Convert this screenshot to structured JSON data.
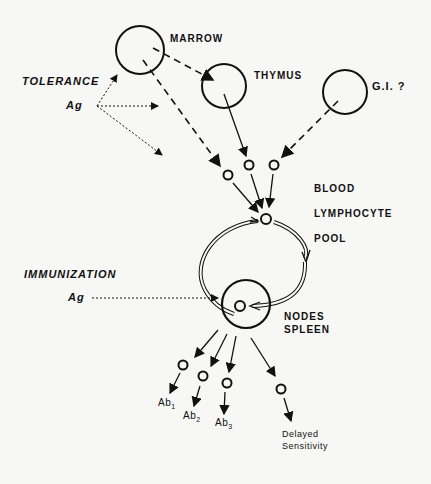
{
  "diagram": {
    "nodes": {
      "marrow": "MARROW",
      "thymus": "THYMUS",
      "gi": "G.I. ?",
      "blood_pool": [
        "BLOOD",
        "LYMPHOCYTE",
        "POOL"
      ],
      "nodes_spleen": [
        "NODES",
        "SPLEEN"
      ]
    },
    "inputs": {
      "tolerance": "TOLERANCE",
      "tolerance_ag": "Ag",
      "immunization": "IMMUNIZATION",
      "immunization_ag": "Ag"
    },
    "outputs": {
      "ab1": "Ab",
      "ab1_sub": "1",
      "ab2": "Ab",
      "ab2_sub": "2",
      "ab3": "Ab",
      "ab3_sub": "3",
      "delayed": [
        "Delayed",
        "Sensitivity"
      ]
    },
    "colors": {
      "ink": "#111111",
      "background": "#f7f7f5"
    }
  }
}
